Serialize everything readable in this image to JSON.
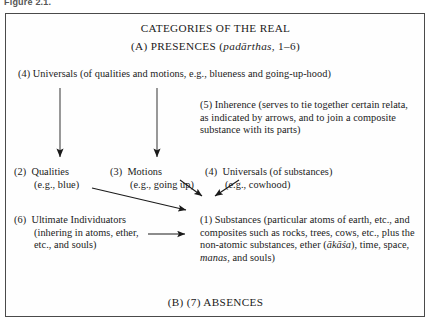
{
  "figure": {
    "caption": "Figure 2.1."
  },
  "diagram": {
    "title": "CATEGORIES OF THE REAL",
    "presences_heading": "(A) PRESENCES (padārthas, 1–6)",
    "presences_heading_parts": {
      "prefix": "(A) PRESENCES (",
      "italic": "padārthas",
      "suffix": ", 1–6)"
    },
    "absences_heading": "(B) (7) ABSENCES",
    "items": [
      {
        "number": "(4)",
        "label": "Universals",
        "text": "(4)  Universals (of qualities and motions, e.g., blueness and going-up-hood)"
      },
      {
        "number": "(5)",
        "label": "Inherence",
        "text": "(5)  Inherence (serves to tie together certain relata, as indicated by arrows, and to join a composite substance with its parts)"
      },
      {
        "number": "(2)",
        "label": "Qualities",
        "line1": "(2)  Qualities",
        "line2": "(e.g., blue)"
      },
      {
        "number": "(3)",
        "label": "Motions",
        "line1": "(3)  Motions",
        "line2": "(e.g., going up)"
      },
      {
        "number": "(4)",
        "label": "Universals (of substances)",
        "line1": "(4)  Universals (of substances)",
        "line2": "(e.g., cowhood)"
      },
      {
        "number": "(6)",
        "label": "Ultimate Individuators",
        "line1": "(6)  Ultimate Individuators",
        "line2": "(inhering in atoms, ether,",
        "line3": "etc., and souls)"
      },
      {
        "number": "(1)",
        "label": "Substances",
        "text": "(1)  Substances (particular atoms of earth, etc., and composites such as rocks, trees, cows, etc., plus the non-atomic substances, ether (ākāśa), time, space, manas, and souls)"
      }
    ],
    "substances_parts": {
      "prefix": "(1)  Substances (particular atoms of earth, etc., and composites such as rocks, trees, cows, etc., plus the non-atomic substances, ether (",
      "italic1": "ākāśa",
      "middle": "), time, space, ",
      "italic2": "manas",
      "suffix": ", and souls)"
    },
    "colors": {
      "border": "#4a4a4a",
      "text": "#1a1a1a",
      "background": "#fefefe",
      "arrow": "#1a1a1a"
    },
    "arrows": [
      {
        "name": "universals-to-qualities",
        "from": [
          60,
          88
        ],
        "to": [
          60,
          158
        ],
        "kind": "vertical"
      },
      {
        "name": "universals-to-motions",
        "from": [
          157,
          88
        ],
        "to": [
          157,
          158
        ],
        "kind": "vertical"
      },
      {
        "name": "qualities-to-substances",
        "from": [
          92,
          188
        ],
        "to": [
          188,
          211
        ],
        "kind": "diagonal"
      },
      {
        "name": "motions-to-substances",
        "from": [
          182,
          181
        ],
        "to": [
          203,
          198
        ],
        "kind": "diagonal"
      },
      {
        "name": "universals-substances-to-substances",
        "from": [
          238,
          180
        ],
        "to": [
          214,
          198
        ],
        "kind": "diagonal"
      },
      {
        "name": "individuators-to-substances",
        "from": [
          148,
          234
        ],
        "to": [
          187,
          234
        ],
        "kind": "horizontal"
      }
    ]
  }
}
